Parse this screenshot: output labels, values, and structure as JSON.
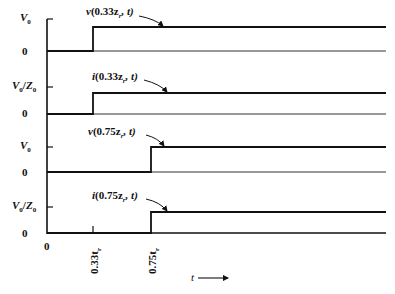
{
  "diagram": {
    "type": "timing-diagram",
    "x_axis": {
      "label": "t",
      "ticks": [
        "0",
        "0.33t_r",
        "0.75t_r"
      ],
      "tick_labels_display": [
        "0",
        "0.33t",
        "0.75t"
      ],
      "tick_subscript": "r"
    },
    "panels": [
      {
        "id": "v033",
        "signal_label": "v(0.33z_r, t)",
        "label_parts": {
          "fn": "v",
          "arg": "(0.33z",
          "sub": "r",
          "rest": ", t)"
        },
        "y_high_label": "V0",
        "y_low_label": "0",
        "step_at": "0.33t_r"
      },
      {
        "id": "i033",
        "signal_label": "i(0.33z_r, t)",
        "label_parts": {
          "fn": "i",
          "arg": "(0.33z",
          "sub": "r",
          "rest": ", t)"
        },
        "y_high_label": "V0/Z0",
        "y_low_label": "0",
        "step_at": "0.33t_r"
      },
      {
        "id": "v075",
        "signal_label": "v(0.75z_r, t)",
        "label_parts": {
          "fn": "v",
          "arg": "(0.75z",
          "sub": "r",
          "rest": ", t)"
        },
        "y_high_label": "V0",
        "y_low_label": "0",
        "step_at": "0.75t_r"
      },
      {
        "id": "i075",
        "signal_label": "i(0.75z_r, t)",
        "label_parts": {
          "fn": "i",
          "arg": "(0.75z",
          "sub": "r",
          "rest": ", t)"
        },
        "y_high_label": "V0/Z0",
        "y_low_label": "0",
        "step_at": "0.75t_r"
      }
    ],
    "labels": {
      "V": "V",
      "zero_sub": "0",
      "slash": "/",
      "Z": "Z",
      "zero": "0",
      "t": "t",
      "t033": "0.33t",
      "t075": "0.75t",
      "r": "r"
    }
  }
}
